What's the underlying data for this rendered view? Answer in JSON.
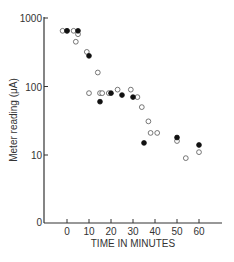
{
  "chart_data": {
    "type": "scatter",
    "title": "",
    "xlabel": "TIME IN MINUTES",
    "ylabel": "Meter reading (μA)",
    "yscale": "log",
    "x_ticks": [
      0,
      10,
      20,
      30,
      40,
      50,
      60
    ],
    "y_ticks": [
      "0",
      "10",
      "100",
      "1000"
    ],
    "xlim": [
      -10,
      70
    ],
    "ylim": [
      1,
      1000
    ],
    "grid": false,
    "legend": "none",
    "series": [
      {
        "name": "open circles",
        "marker": "open-circle",
        "points": [
          [
            -2,
            650
          ],
          [
            0,
            650
          ],
          [
            3,
            650
          ],
          [
            5,
            580
          ],
          [
            4,
            450
          ],
          [
            9,
            320
          ],
          [
            14,
            160
          ],
          [
            10,
            80
          ],
          [
            15,
            80
          ],
          [
            16,
            80
          ],
          [
            19,
            80
          ],
          [
            23,
            90
          ],
          [
            29,
            90
          ],
          [
            32,
            70
          ],
          [
            34,
            50
          ],
          [
            37,
            31
          ],
          [
            38,
            21
          ],
          [
            41,
            21
          ],
          [
            50,
            16
          ],
          [
            54,
            9
          ],
          [
            60,
            11
          ]
        ]
      },
      {
        "name": "filled circles",
        "marker": "filled-circle",
        "points": [
          [
            0,
            650
          ],
          [
            5,
            650
          ],
          [
            10,
            280
          ],
          [
            15,
            60
          ],
          [
            20,
            80
          ],
          [
            25,
            75
          ],
          [
            30,
            70
          ],
          [
            35,
            15
          ],
          [
            50,
            18
          ],
          [
            60,
            14
          ]
        ]
      }
    ]
  }
}
